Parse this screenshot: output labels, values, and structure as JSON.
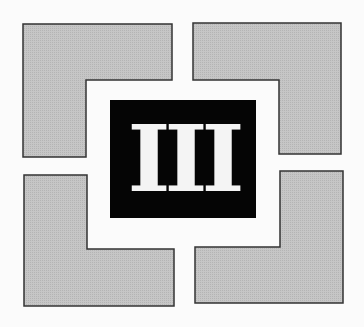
{
  "emblem": {
    "numeral": "III",
    "colors": {
      "background": "#fbfbfb",
      "panel_fill": "#c4c4c4",
      "panel_stroke": "#333333",
      "center_fill": "#050505",
      "numeral_fill": "#f4f4f4"
    }
  }
}
